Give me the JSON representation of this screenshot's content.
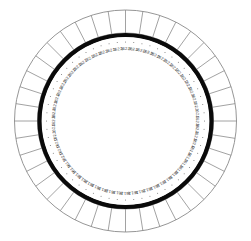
{
  "figure": {
    "type": "radial-dial",
    "canvas": {
      "width": 251,
      "height": 241
    },
    "center": {
      "x": 125.5,
      "y": 121
    }
  },
  "colors": {
    "background": "#ffffff",
    "outer_ring_stroke": "#8a8a8a",
    "heavy_ring_stroke": "#0a0a0a",
    "label_text": "#3a3a3a",
    "tick_dot": "#6e6e6e"
  },
  "outer_ring": {
    "name": "segmented-outer-ring",
    "outer_radius": 111,
    "inner_radius": 88,
    "segment_count": 40,
    "stroke_width": 0.8
  },
  "heavy_ring": {
    "name": "heavy-black-ring",
    "radius": 86,
    "stroke_width": 4.2
  },
  "scale": {
    "name": "inner-numeric-scale",
    "label_radius": 72,
    "tick_radius": 79,
    "tick_count": 60,
    "label_count": 60,
    "units": "",
    "min_value": 161.8,
    "max_value": 162.3,
    "top_value": "162.3",
    "right_value": "162.1",
    "bottom_value": "161.8",
    "left_value": "162.1",
    "labels": [
      "162.3",
      "162.3",
      "162.3",
      "162.2",
      "162.2",
      "162.2",
      "162.2",
      "162.2",
      "162.2",
      "162.2",
      "162.2",
      "162.1",
      "162.1",
      "162.1",
      "162.1",
      "162.1",
      "162.1",
      "162.0",
      "162.0",
      "161.9",
      "161.9",
      "161.9",
      "161.8",
      "161.8",
      "161.8",
      "161.8",
      "161.8",
      "161.8",
      "161.8",
      "161.8",
      "161.8",
      "161.8",
      "161.8",
      "161.8",
      "161.8",
      "161.8",
      "161.8",
      "161.9",
      "161.9",
      "161.9",
      "162.0",
      "162.0",
      "162.0",
      "162.1",
      "162.1",
      "162.1",
      "162.1",
      "162.1",
      "162.2",
      "162.2",
      "162.2",
      "162.2",
      "162.2",
      "162.2",
      "162.2",
      "162.2",
      "162.2",
      "162.3",
      "162.3",
      "162.3"
    ]
  },
  "chart_data": {
    "type": "line",
    "xlabel": "Angle (degrees)",
    "ylabel": "Value",
    "ylim": [
      161.8,
      162.3
    ],
    "grid": false,
    "legend": "none",
    "categories": [
      "0",
      "6",
      "12",
      "18",
      "24",
      "30",
      "36",
      "42",
      "48",
      "54",
      "60",
      "66",
      "72",
      "78",
      "84",
      "90",
      "96",
      "102",
      "108",
      "114",
      "120",
      "126",
      "132",
      "138",
      "144",
      "150",
      "156",
      "162",
      "168",
      "174",
      "180",
      "186",
      "192",
      "198",
      "204",
      "210",
      "216",
      "222",
      "228",
      "234",
      "240",
      "246",
      "252",
      "258",
      "264",
      "270",
      "276",
      "282",
      "288",
      "294",
      "300",
      "306",
      "312",
      "318",
      "324",
      "330",
      "336",
      "342",
      "348",
      "354"
    ],
    "values": [
      162.3,
      162.3,
      162.3,
      162.2,
      162.2,
      162.2,
      162.2,
      162.2,
      162.2,
      162.2,
      162.2,
      162.1,
      162.1,
      162.1,
      162.1,
      162.1,
      162.1,
      162.0,
      162.0,
      161.9,
      161.9,
      161.9,
      161.8,
      161.8,
      161.8,
      161.8,
      161.8,
      161.8,
      161.8,
      161.8,
      161.8,
      161.8,
      161.8,
      161.8,
      161.8,
      161.8,
      161.8,
      161.9,
      161.9,
      161.9,
      162.0,
      162.0,
      162.0,
      162.1,
      162.1,
      162.1,
      162.1,
      162.1,
      162.2,
      162.2,
      162.2,
      162.2,
      162.2,
      162.2,
      162.2,
      162.2,
      162.2,
      162.3,
      162.3,
      162.3
    ]
  }
}
